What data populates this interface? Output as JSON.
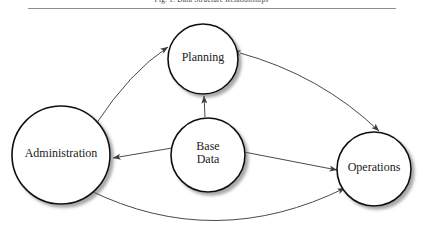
{
  "caption": {
    "text": "Fig. 1. Data Structure Relationships"
  },
  "diagram": {
    "stroke_color": "#1a1a1a",
    "arrow_color": "#444444",
    "node_fill": "#ffffff",
    "nodes": [
      {
        "id": "planning",
        "label": "Planning",
        "lines": [
          "Planning"
        ],
        "cx": 203,
        "cy": 59,
        "r": 35,
        "font_size": 12
      },
      {
        "id": "administration",
        "label": "Administration",
        "lines": [
          "Administration"
        ],
        "cx": 61,
        "cy": 155,
        "r": 49,
        "font_size": 12
      },
      {
        "id": "base-data",
        "label": "Base Data",
        "lines": [
          "Base",
          "Data"
        ],
        "cx": 208,
        "cy": 155,
        "r": 37,
        "font_size": 12
      },
      {
        "id": "operations",
        "label": "Operations",
        "cx": 374,
        "cy": 169,
        "lines": [
          "Operations"
        ],
        "r": 37,
        "font_size": 12
      }
    ],
    "connections": [
      {
        "id": "administration-planning",
        "from": "administration",
        "to": "planning",
        "style": "curved",
        "heads": "both"
      },
      {
        "id": "planning-operations",
        "from": "planning",
        "to": "operations",
        "style": "curved",
        "heads": "both"
      },
      {
        "id": "administration-operations",
        "from": "administration",
        "to": "operations",
        "style": "curved",
        "heads": "both"
      },
      {
        "id": "base-data-planning",
        "from": "base-data",
        "to": "planning",
        "style": "straight",
        "heads": "single"
      },
      {
        "id": "base-data-administration",
        "from": "base-data",
        "to": "administration",
        "style": "straight",
        "heads": "single"
      },
      {
        "id": "base-data-operations",
        "from": "base-data",
        "to": "operations",
        "style": "straight",
        "heads": "single"
      }
    ]
  }
}
